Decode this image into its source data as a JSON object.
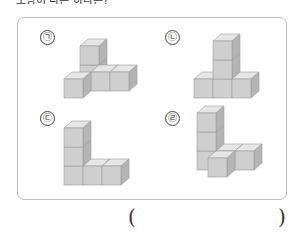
{
  "question_fragment": "모양이 다른 하나는?",
  "panel": {
    "options": [
      {
        "label": "㉠",
        "name": "option-a"
      },
      {
        "label": "㉡",
        "name": "option-b"
      },
      {
        "label": "㉢",
        "name": "option-c"
      },
      {
        "label": "㉣",
        "name": "option-d"
      }
    ]
  },
  "answer": {
    "open_paren": "(",
    "close_paren": ")",
    "value": ""
  },
  "colors": {
    "cube_top": "#e6e6e6",
    "cube_front": "#cfcfcf",
    "cube_side": "#b4b4b4",
    "cube_edge": "#9a9a9a",
    "frame_border": "#bdbdbd"
  }
}
